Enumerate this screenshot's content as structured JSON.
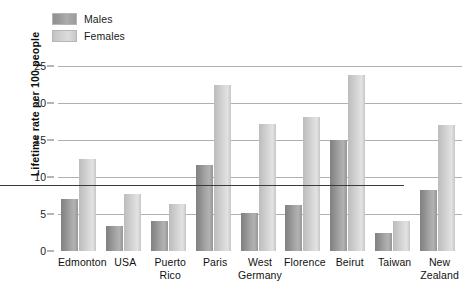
{
  "legend": {
    "items": [
      {
        "label": "Males",
        "color": "#a0a0a0",
        "key": "males"
      },
      {
        "label": "Females",
        "color": "#d4d4d4",
        "key": "females"
      }
    ]
  },
  "axes": {
    "y_title": "Lifetime rate per 100 people",
    "y_ticks": [
      "0",
      "5",
      "10",
      "15",
      "20",
      "25"
    ]
  },
  "chart_data": {
    "type": "bar",
    "title": "",
    "xlabel": "",
    "ylabel": "Lifetime rate per 100 people",
    "ylim": [
      0,
      25
    ],
    "ytick_values": [
      0,
      5,
      10,
      15,
      20,
      25
    ],
    "grid": true,
    "legend_position": "top-left",
    "categories": [
      "Edmonton",
      "USA",
      "Puerto Rico",
      "Paris",
      "West Germany",
      "Florence",
      "Beirut",
      "Taiwan",
      "New Zealand"
    ],
    "category_lines": [
      [
        "Edmonton"
      ],
      [
        "USA"
      ],
      [
        "Puerto",
        "Rico"
      ],
      [
        "Paris"
      ],
      [
        "West",
        "Germany"
      ],
      [
        "Florence"
      ],
      [
        "Beirut"
      ],
      [
        "Taiwan"
      ],
      [
        "New",
        "Zealand"
      ]
    ],
    "series": [
      {
        "name": "Males",
        "color": "#a0a0a0",
        "values": [
          7.0,
          3.4,
          4.1,
          11.6,
          5.1,
          6.2,
          15.0,
          2.4,
          8.3
        ]
      },
      {
        "name": "Females",
        "color": "#d4d4d4",
        "values": [
          12.5,
          7.7,
          6.4,
          22.5,
          17.1,
          18.1,
          23.8,
          4.1,
          17.0
        ]
      }
    ]
  }
}
